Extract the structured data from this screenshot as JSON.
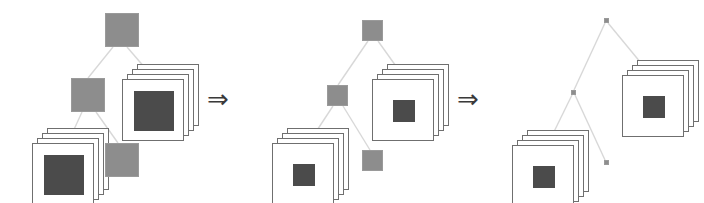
{
  "figure": {
    "background_color": "#ffffff",
    "node_color": "#8d8d8d",
    "node_border_color": "#9a9a9a",
    "card_color": "#ffffff",
    "card_border_color": "#6f6f6f",
    "card_inner_color": "#4b4b4b",
    "edge_color": "#d8d8d8",
    "arrow_color": "#3a3a3a"
  },
  "arrows": [
    {
      "glyph": "⇒",
      "name": "transition-arrow-1",
      "x": 207,
      "y": 86
    },
    {
      "glyph": "⇒",
      "name": "transition-arrow-2",
      "x": 457,
      "y": 86
    }
  ],
  "panels": [
    {
      "id": "stage-1",
      "label": "Stage 1",
      "offset_x": 0,
      "node_size": 34,
      "card_inner_size": 40,
      "nodes": [
        {
          "name": "root-node",
          "x": 105,
          "y": 13
        },
        {
          "name": "internal-node",
          "x": 71,
          "y": 78
        },
        {
          "name": "leaf-node-bottom",
          "x": 105,
          "y": 143
        }
      ],
      "stacks": [
        {
          "name": "document-stack-right",
          "x": 122,
          "y": 64
        },
        {
          "name": "document-stack-left",
          "x": 32,
          "y": 128
        }
      ],
      "edges": [
        {
          "name": "edge-root-to-internal",
          "x1": 113,
          "y1": 47,
          "x2": 88,
          "y2": 78
        },
        {
          "name": "edge-root-to-stack",
          "x1": 127,
          "y1": 47,
          "x2": 158,
          "y2": 83
        },
        {
          "name": "edge-internal-to-stack",
          "x1": 82,
          "y1": 112,
          "x2": 66,
          "y2": 147
        },
        {
          "name": "edge-internal-to-leaf",
          "x1": 96,
          "y1": 112,
          "x2": 118,
          "y2": 143
        }
      ]
    },
    {
      "id": "stage-2",
      "label": "Stage 2",
      "offset_x": 235,
      "node_size": 21,
      "card_inner_size": 22,
      "nodes": [
        {
          "name": "root-node",
          "x": 362,
          "y": 20
        },
        {
          "name": "internal-node",
          "x": 327,
          "y": 85
        },
        {
          "name": "leaf-node-bottom",
          "x": 362,
          "y": 150
        }
      ],
      "stacks": [
        {
          "name": "document-stack-right",
          "x": 372,
          "y": 64
        },
        {
          "name": "document-stack-left",
          "x": 272,
          "y": 128
        }
      ],
      "edges": [
        {
          "name": "edge-root-to-internal",
          "x1": 368,
          "y1": 41,
          "x2": 338,
          "y2": 85
        },
        {
          "name": "edge-root-to-stack",
          "x1": 378,
          "y1": 41,
          "x2": 408,
          "y2": 83
        },
        {
          "name": "edge-internal-to-stack",
          "x1": 333,
          "y1": 106,
          "x2": 306,
          "y2": 147
        },
        {
          "name": "edge-internal-to-leaf",
          "x1": 343,
          "y1": 106,
          "x2": 370,
          "y2": 150
        }
      ]
    },
    {
      "id": "stage-3",
      "label": "Stage 3",
      "offset_x": 470,
      "node_size": 5,
      "card_inner_size": 22,
      "nodes": [
        {
          "name": "root-node",
          "x": 604,
          "y": 18
        },
        {
          "name": "internal-node",
          "x": 571,
          "y": 90
        },
        {
          "name": "leaf-node-bottom",
          "x": 604,
          "y": 160
        }
      ],
      "stacks": [
        {
          "name": "document-stack-right",
          "x": 622,
          "y": 60
        },
        {
          "name": "document-stack-left",
          "x": 512,
          "y": 130
        }
      ],
      "edges": [
        {
          "name": "edge-root-to-internal",
          "x1": 605,
          "y1": 23,
          "x2": 574,
          "y2": 90
        },
        {
          "name": "edge-root-to-stack",
          "x1": 608,
          "y1": 23,
          "x2": 655,
          "y2": 80
        },
        {
          "name": "edge-internal-to-stack",
          "x1": 572,
          "y1": 95,
          "x2": 546,
          "y2": 148
        },
        {
          "name": "edge-internal-to-leaf",
          "x1": 575,
          "y1": 95,
          "x2": 605,
          "y2": 160
        }
      ]
    }
  ],
  "stack_geometry": {
    "card_size": 62,
    "card_count": 4,
    "card_offset_x": 5,
    "card_offset_y": 5
  }
}
